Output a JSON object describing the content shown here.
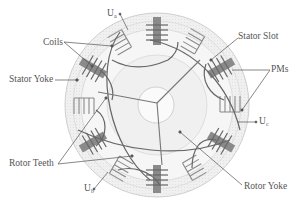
{
  "figure": {
    "type": "flux-switching permanent magnet machine cross-section",
    "center": [
      157,
      105
    ],
    "outer_radius": 92,
    "shaft_radius": 18,
    "stator_coil_count": 12,
    "pm_count": 6,
    "colors": {
      "outline": "#777777",
      "stator_fill": "#eeeeee",
      "rotor_fill": "#f1f1f1",
      "pm_fill": "#8a8a8a",
      "winding_line": "#555555",
      "label_text": "#555555"
    }
  },
  "labels": {
    "coils": "Coils",
    "stator_yoke": "Stator Yoke",
    "rotor_teeth": "Rotor Teeth",
    "stator_slot": "Stator Slot",
    "pms": "PMs",
    "rotor_yoke": "Rotor Yoke",
    "phase_a": {
      "main": "U",
      "sub": "a"
    },
    "phase_b": {
      "main": "U",
      "sub": "b"
    },
    "phase_c": {
      "main": "U",
      "sub": "c"
    }
  }
}
